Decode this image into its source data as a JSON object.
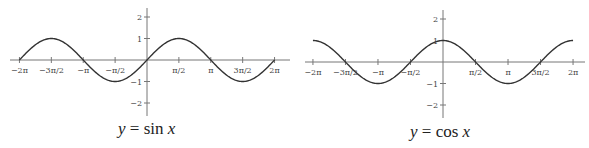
{
  "chart_data": [
    {
      "type": "line",
      "title": "y = sin x",
      "caption": {
        "lhs": "y",
        "eq": " = ",
        "fn": "sin ",
        "var": "x"
      },
      "function": "sin",
      "xlabel": "",
      "ylabel": "",
      "xlim": [
        -6.2832,
        6.2832
      ],
      "ylim": [
        -2.5,
        2.5
      ],
      "grid": false,
      "legend": "none",
      "x_ticks": [
        {
          "value": -6.2832,
          "label": "−2π"
        },
        {
          "value": -4.7124,
          "label": "−3π/2"
        },
        {
          "value": -3.1416,
          "label": "−π"
        },
        {
          "value": -1.5708,
          "label": "−π/2"
        },
        {
          "value": 1.5708,
          "label": "π/2"
        },
        {
          "value": 3.1416,
          "label": "π"
        },
        {
          "value": 4.7124,
          "label": "3π/2"
        },
        {
          "value": 6.2832,
          "label": "2π"
        }
      ],
      "y_ticks": [
        {
          "value": 2,
          "label": "2"
        },
        {
          "value": 1,
          "label": "1"
        },
        {
          "value": -1,
          "label": "−1"
        },
        {
          "value": -2,
          "label": "−2"
        }
      ],
      "series": [
        {
          "name": "sin x",
          "x": [
            -6.2832,
            -4.7124,
            -3.1416,
            -1.5708,
            0,
            1.5708,
            3.1416,
            4.7124,
            6.2832
          ],
          "values": [
            0,
            1,
            0,
            -1,
            0,
            1,
            0,
            -1,
            0
          ]
        }
      ]
    },
    {
      "type": "line",
      "title": "y = cos x",
      "caption": {
        "lhs": "y",
        "eq": " = ",
        "fn": "cos ",
        "var": "x"
      },
      "function": "cos",
      "xlabel": "",
      "ylabel": "",
      "xlim": [
        -6.2832,
        6.2832
      ],
      "ylim": [
        -2.5,
        2.5
      ],
      "grid": false,
      "legend": "none",
      "x_ticks": [
        {
          "value": -6.2832,
          "label": "−2π"
        },
        {
          "value": -4.7124,
          "label": "−3π/2"
        },
        {
          "value": -3.1416,
          "label": "−π"
        },
        {
          "value": -1.5708,
          "label": "−π/2"
        },
        {
          "value": 1.5708,
          "label": "π/2"
        },
        {
          "value": 3.1416,
          "label": "π"
        },
        {
          "value": 4.7124,
          "label": "3π/2"
        },
        {
          "value": 6.2832,
          "label": "2π"
        }
      ],
      "y_ticks": [
        {
          "value": 2,
          "label": "2"
        },
        {
          "value": 1,
          "label": "1"
        },
        {
          "value": -1,
          "label": "−1"
        },
        {
          "value": -2,
          "label": "−2"
        }
      ],
      "series": [
        {
          "name": "cos x",
          "x": [
            -6.2832,
            -4.7124,
            -3.1416,
            -1.5708,
            0,
            1.5708,
            3.1416,
            4.7124,
            6.2832
          ],
          "values": [
            1,
            0,
            -1,
            0,
            1,
            0,
            -1,
            0,
            1
          ]
        }
      ]
    }
  ],
  "layout": {
    "plots": [
      {
        "origin_x": 147,
        "origin_y": 60,
        "px_per_unit_x": 20.3,
        "px_per_unit_y": 21.5,
        "axis_x_from": 10,
        "axis_x_to": 290,
        "axis_y_from": 8,
        "axis_y_to": 116
      },
      {
        "origin_x": 443,
        "origin_y": 62,
        "px_per_unit_x": 20.7,
        "px_per_unit_y": 21.5,
        "axis_x_from": 305,
        "axis_x_to": 585,
        "axis_y_from": 10,
        "axis_y_to": 118
      }
    ],
    "curve_color": "#333333",
    "axis_color": "#777777"
  }
}
